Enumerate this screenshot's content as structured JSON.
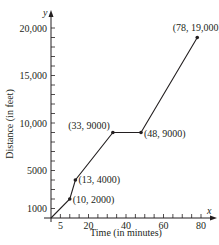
{
  "chart_data": {
    "type": "line",
    "title": "",
    "xlabel": "Time (in minutes)",
    "ylabel": "Distance (in feet)",
    "x_axis_var": "x",
    "y_axis_var": "y",
    "xlim": [
      0,
      85
    ],
    "ylim": [
      0,
      21000
    ],
    "x_ticks": [
      5,
      20,
      40,
      60,
      80
    ],
    "x_tick_labels": [
      "5",
      "20",
      "40",
      "60",
      "80"
    ],
    "x_minor_tick_step": 5,
    "y_ticks": [
      1000,
      5000,
      10000,
      15000,
      20000
    ],
    "y_tick_labels": [
      "1000",
      "5000",
      "10,000",
      "15,000",
      "20,000"
    ],
    "y_minor_tick_step": 1000,
    "grid": false,
    "legend": null,
    "series": [
      {
        "name": "Distance",
        "x": [
          0,
          10,
          13,
          33,
          48,
          78
        ],
        "y": [
          0,
          2000,
          4000,
          9000,
          9000,
          19000
        ]
      }
    ],
    "points": [
      {
        "x": 10,
        "y": 2000,
        "label": "(10, 2000)"
      },
      {
        "x": 13,
        "y": 4000,
        "label": "(13, 4000)"
      },
      {
        "x": 33,
        "y": 9000,
        "label": "(33, 9000)"
      },
      {
        "x": 48,
        "y": 9000,
        "label": "(48, 9000)"
      },
      {
        "x": 78,
        "y": 19000,
        "label": "(78, 19,000)"
      }
    ],
    "color": "#231f20"
  }
}
